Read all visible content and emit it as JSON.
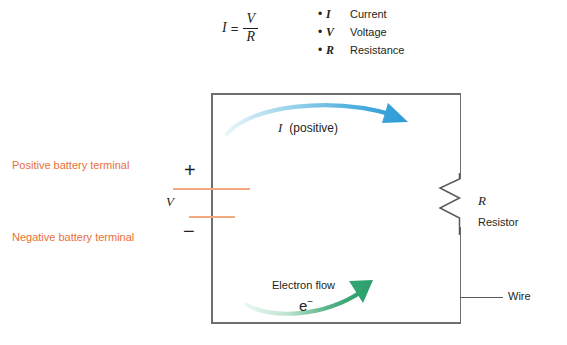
{
  "formula": {
    "lhs": "I",
    "equals": "=",
    "numerator": "V",
    "denominator": "R"
  },
  "legend": {
    "bullet": "•",
    "items": [
      {
        "symbol": "I",
        "label": "Current"
      },
      {
        "symbol": "V",
        "label": "Voltage"
      },
      {
        "symbol": "R",
        "label": "Resistance"
      }
    ]
  },
  "battery": {
    "positive_terminal_label": "Positive battery terminal",
    "negative_terminal_label": "Negative battery terminal",
    "plus_sign": "+",
    "minus_sign": "−",
    "voltage_label": "V",
    "plate_color": "#f2a87e",
    "label_color": "#e8703a"
  },
  "resistor": {
    "symbol_label": "R",
    "name_label": "Resistor"
  },
  "wire": {
    "name_label": "Wire",
    "color": "#6d6e71"
  },
  "current": {
    "symbol": "I",
    "qualifier": "(positive)",
    "arrow_color_start": "#cfe8f3",
    "arrow_color_end": "#2e9bd6"
  },
  "electron": {
    "flow_label": "Electron flow",
    "symbol": "e",
    "charge_sign": "−",
    "arrow_color_start": "#d9eee3",
    "arrow_color_end": "#2aa06b"
  }
}
